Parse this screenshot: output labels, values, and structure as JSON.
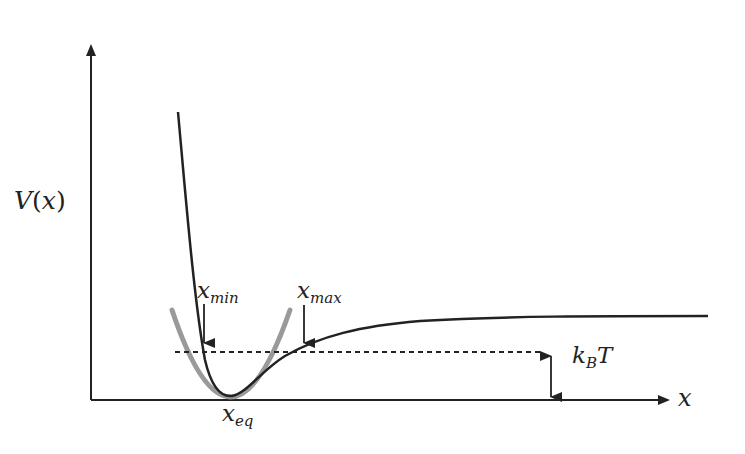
{
  "diagram": {
    "axes": {
      "y_label": "V(x)",
      "y_label_main": "V",
      "y_label_paren_open": "(",
      "y_label_arg": "x",
      "y_label_paren_close": ")",
      "x_label": "x"
    },
    "labels": {
      "x_min": {
        "base": "x",
        "sub": "min"
      },
      "x_max": {
        "base": "x",
        "sub": "max"
      },
      "x_eq": {
        "base": "x",
        "sub": "eq"
      },
      "kbt": {
        "k": "k",
        "sub": "B",
        "T": "T"
      }
    },
    "curves": [
      {
        "name": "anharmonic potential (Morse-like)",
        "color": "#222222"
      },
      {
        "name": "harmonic approximation (parabola)",
        "color": "#999999"
      },
      {
        "name": "thermal energy level k_B T (dashed)",
        "color": "#222222"
      }
    ],
    "colors": {
      "axis": "#222222",
      "potential": "#222222",
      "parabola": "#9a9a9a",
      "background": "#ffffff"
    }
  }
}
